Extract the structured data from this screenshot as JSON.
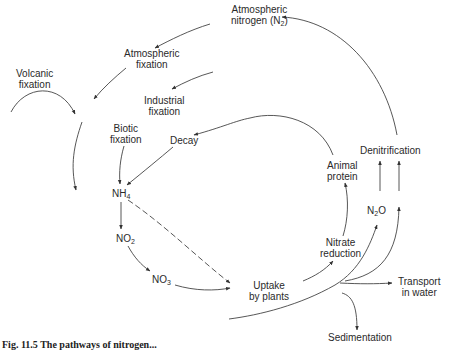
{
  "diagram": {
    "nodes": {
      "atmospheric_nitrogen": {
        "line1": "Atmospheric",
        "line2": "nitrogen (N",
        "sub": "2",
        "tail": ")"
      },
      "atmospheric_fixation": {
        "line1": "Atmospheric",
        "line2": "fixation"
      },
      "volcanic_fixation": {
        "line1": "Volcanic",
        "line2": "fixation"
      },
      "industrial_fixation": {
        "line1": "Industrial",
        "line2": "fixation"
      },
      "biotic_fixation": {
        "line1": "Biotic",
        "line2": "fixation"
      },
      "decay": {
        "label": "Decay"
      },
      "nh4": {
        "main": "NH",
        "sub": "4"
      },
      "no2": {
        "main": "NO",
        "sub": "2"
      },
      "no3": {
        "main": "NO",
        "sub": "3"
      },
      "uptake": {
        "line1": "Uptake",
        "line2": "by plants"
      },
      "nitrate_reduction": {
        "line1": "Nitrate",
        "line2": "reduction"
      },
      "animal_protein": {
        "line1": "Animal",
        "line2": "protein"
      },
      "denitrification": {
        "label": "Denitrification"
      },
      "n2o": {
        "main": "N",
        "sub": "2",
        "tail": "O"
      },
      "transport": {
        "line1": "Transport",
        "line2": "in water"
      },
      "sedimentation": {
        "label": "Sedimentation"
      }
    },
    "edges": [
      {
        "from": "Atmospheric nitrogen (N2)",
        "to": "Atmospheric fixation"
      },
      {
        "from": "Atmospheric fixation",
        "to": "NH4 pool"
      },
      {
        "from": "Volcanic fixation",
        "to": "NH4 pool"
      },
      {
        "from": "external",
        "to": "Industrial fixation"
      },
      {
        "from": "Animal protein",
        "to": "Decay"
      },
      {
        "from": "Biotic fixation",
        "to": "NH4"
      },
      {
        "from": "Decay",
        "to": "NH4"
      },
      {
        "from": "NH4",
        "to": "NO2"
      },
      {
        "from": "NO2",
        "to": "NO3"
      },
      {
        "from": "NO3",
        "to": "Uptake by plants"
      },
      {
        "from": "NH4",
        "to": "Uptake by plants",
        "style": "dashed"
      },
      {
        "from": "Uptake by plants",
        "to": "Nitrate reduction"
      },
      {
        "from": "Nitrate reduction",
        "to": "Animal protein"
      },
      {
        "from": "N2O",
        "to": "Denitrification"
      },
      {
        "from": "water flow",
        "to": "N2O"
      },
      {
        "from": "water flow",
        "to": "Denitrification"
      },
      {
        "from": "water flow",
        "to": "Transport in water"
      },
      {
        "from": "water flow",
        "to": "Sedimentation"
      },
      {
        "from": "Denitrification",
        "to": "Atmospheric nitrogen (N2)"
      }
    ],
    "caption": "Fig. 11.5 The pathways of nitrogen..."
  }
}
